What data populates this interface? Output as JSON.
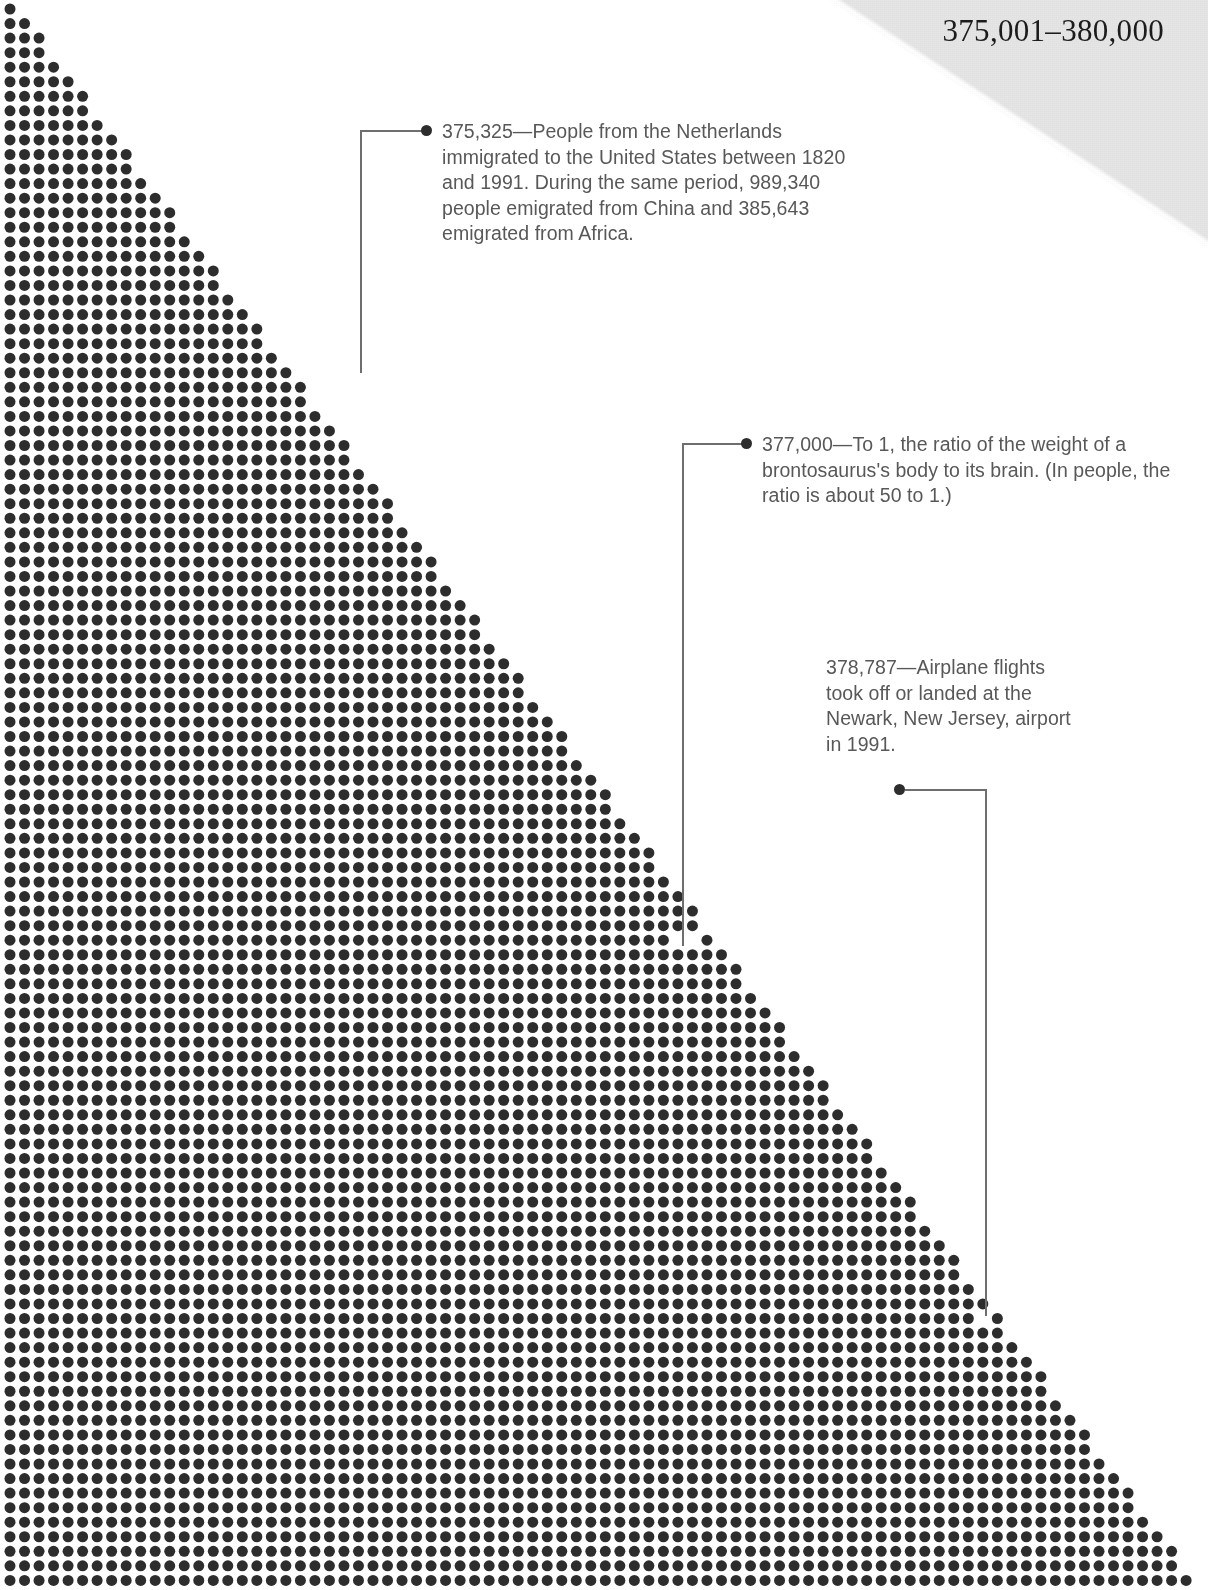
{
  "page": {
    "range_title": "375,001–380,000",
    "background_color": "#ffffff",
    "dot_color": "#2d2d2d",
    "wedge_color": "#e6e6e6",
    "text_color": "#58585a",
    "leader_color": "#6e6e70",
    "width": 1208,
    "height": 1590
  },
  "annotations": [
    {
      "id": "ann1",
      "value": "375,325",
      "text": "375,325—People from the Netherlands immigrated to the United States between 1820 and 1991. During the same period, 989,340 people emigrated from China and 385,643 emigrated from Africa.",
      "marker_dot": {
        "x": 362,
        "y": 372
      }
    },
    {
      "id": "ann2",
      "value": "377,000",
      "text": "377,000—To 1, the ratio of the weight of a brontosaurus's body to its brain. (In people, the ratio is about 50 to 1.)",
      "marker_dot": {
        "x": 684,
        "y": 944
      }
    },
    {
      "id": "ann3",
      "value": "378,787",
      "text": "378,787—Airplane flights took off or landed at the Newark, New Jersey, airport in 1991.",
      "marker_dot": {
        "x": 986,
        "y": 1314
      }
    }
  ],
  "chart_data": {
    "type": "scatter",
    "title": "375,001–380,000",
    "xlabel": "",
    "ylabel": "",
    "grid": false,
    "legend": null,
    "dot_grid": {
      "origin_x": 10,
      "origin_y": 9,
      "step_x": 14.52,
      "step_y": 14.55,
      "dot_diameter": 11,
      "columns": 82,
      "rows": 109
    },
    "boundary": {
      "kind": "diagonal-staircase",
      "top_left_filled_columns": 1,
      "bottom_filled_columns": 82,
      "note": "Row r (0-based) is filled for columns 0..min(81, round(r*0.755)+0)."
    },
    "highlighted_points": [
      {
        "label": "375,325",
        "x": 362,
        "y": 372
      },
      {
        "label": "377,000",
        "x": 684,
        "y": 944
      },
      {
        "label": "378,787",
        "x": 986,
        "y": 1314
      }
    ]
  }
}
